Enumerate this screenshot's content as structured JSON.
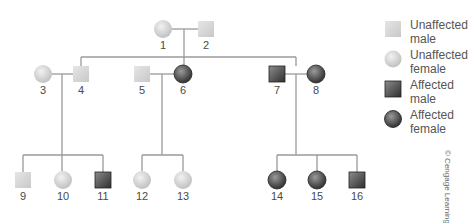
{
  "colors": {
    "line": "#9a9a9a",
    "unaffected_fill": "#d4d4d4",
    "affected_fill": "#4a4a4a",
    "number_text": "#4a4a4a"
  },
  "individuals": [
    {
      "id": "1",
      "sex": "female",
      "affected": false,
      "generation": 1
    },
    {
      "id": "2",
      "sex": "male",
      "affected": false,
      "generation": 1
    },
    {
      "id": "3",
      "sex": "female",
      "affected": false,
      "generation": 2
    },
    {
      "id": "4",
      "sex": "male",
      "affected": false,
      "generation": 2
    },
    {
      "id": "5",
      "sex": "male",
      "affected": false,
      "generation": 2
    },
    {
      "id": "6",
      "sex": "female",
      "affected": true,
      "generation": 2
    },
    {
      "id": "7",
      "sex": "male",
      "affected": true,
      "generation": 2
    },
    {
      "id": "8",
      "sex": "female",
      "affected": true,
      "generation": 2
    },
    {
      "id": "9",
      "sex": "male",
      "affected": false,
      "generation": 3
    },
    {
      "id": "10",
      "sex": "female",
      "affected": false,
      "generation": 3
    },
    {
      "id": "11",
      "sex": "male",
      "affected": true,
      "generation": 3
    },
    {
      "id": "12",
      "sex": "female",
      "affected": false,
      "generation": 3
    },
    {
      "id": "13",
      "sex": "female",
      "affected": false,
      "generation": 3
    },
    {
      "id": "14",
      "sex": "female",
      "affected": true,
      "generation": 3
    },
    {
      "id": "15",
      "sex": "female",
      "affected": true,
      "generation": 3
    },
    {
      "id": "16",
      "sex": "male",
      "affected": true,
      "generation": 3
    }
  ],
  "matings": [
    {
      "partners": [
        "1",
        "2"
      ],
      "children": [
        "4",
        "6",
        "7"
      ]
    },
    {
      "partners": [
        "3",
        "4"
      ],
      "children": [
        "9",
        "10",
        "11"
      ]
    },
    {
      "partners": [
        "5",
        "6"
      ],
      "children": [
        "12",
        "13"
      ]
    },
    {
      "partners": [
        "7",
        "8"
      ],
      "children": [
        "14",
        "15",
        "16"
      ]
    }
  ],
  "labels": {
    "n1": "1",
    "n2": "2",
    "n3": "3",
    "n4": "4",
    "n5": "5",
    "n6": "6",
    "n7": "7",
    "n8": "8",
    "n9": "9",
    "n10": "10",
    "n11": "11",
    "n12": "12",
    "n13": "13",
    "n14": "14",
    "n15": "15",
    "n16": "16"
  },
  "legend": {
    "items": [
      {
        "label": "Unaffected male",
        "line1": "Unaffected",
        "line2": "male",
        "symbol": "square-unaffected"
      },
      {
        "label": "Unaffected female",
        "line1": "Unaffected",
        "line2": "female",
        "symbol": "circle-unaffected"
      },
      {
        "label": "Affected male",
        "line1": "Affected",
        "line2": "male",
        "symbol": "square-affected"
      },
      {
        "label": "Affected female",
        "line1": "Affected",
        "line2": "female",
        "symbol": "circle-affected"
      }
    ]
  },
  "credit": "© Cengage Learning"
}
